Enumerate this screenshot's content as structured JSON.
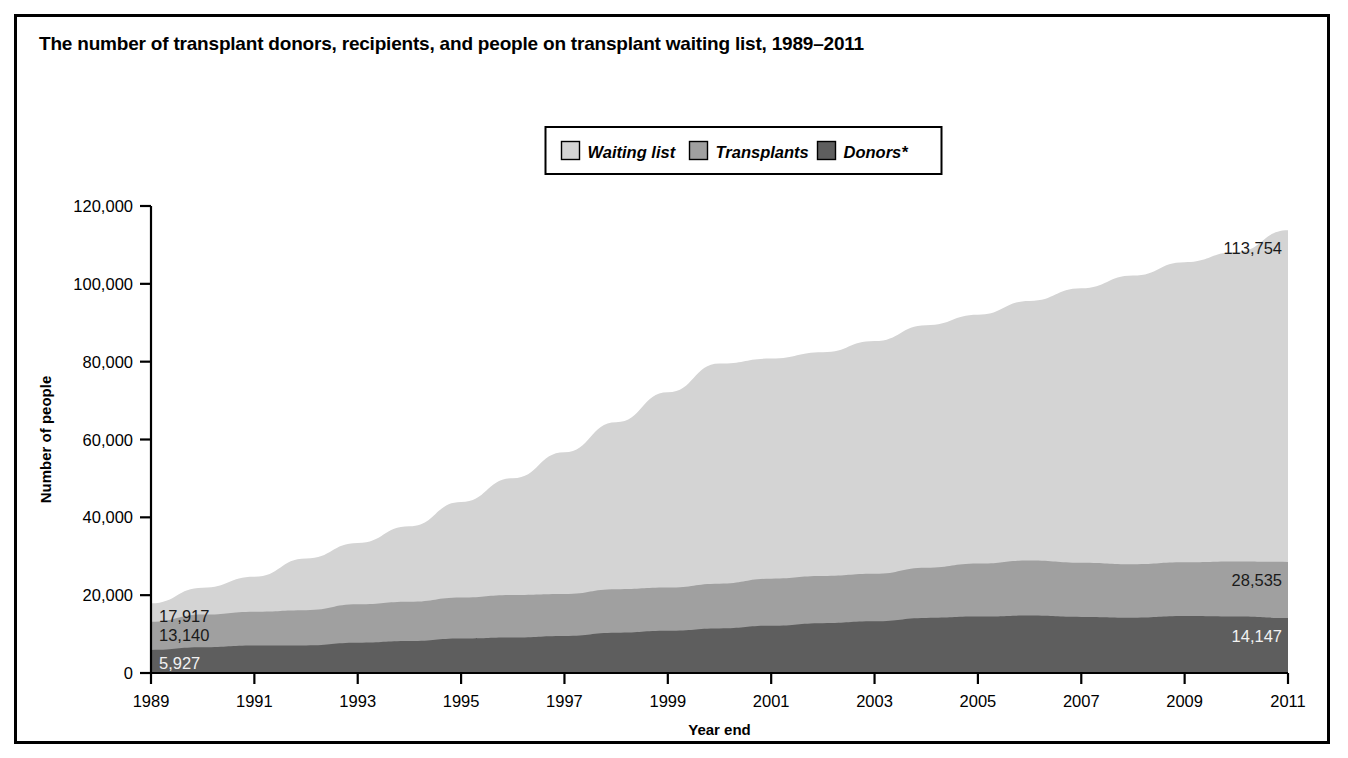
{
  "figure": {
    "title": "The number of transplant donors, recipients, and people on transplant waiting list, 1989–2011",
    "border_color": "#000000",
    "background": "#ffffff"
  },
  "legend": {
    "position": "top-center",
    "items": [
      {
        "label": "Waiting list",
        "color": "#d4d4d4",
        "name": "waiting-list"
      },
      {
        "label": "Transplants",
        "color": "#a0a0a0",
        "name": "transplants"
      },
      {
        "label": "Donors*",
        "color": "#5e5e5e",
        "name": "donors"
      }
    ]
  },
  "annotations": {
    "left": [
      {
        "text": "17,917",
        "series": "Waiting list",
        "light": false
      },
      {
        "text": "13,140",
        "series": "Transplants",
        "light": false
      },
      {
        "text": "5,927",
        "series": "Donors*",
        "light": true
      }
    ],
    "right": [
      {
        "text": "113,754",
        "series": "Waiting list",
        "light": false
      },
      {
        "text": "28,535",
        "series": "Transplants",
        "light": false
      },
      {
        "text": "14,147",
        "series": "Donors*",
        "light": true
      }
    ]
  },
  "chart_data": {
    "type": "area",
    "title": "The number of transplant donors, recipients, and people on transplant waiting list, 1989–2011",
    "xlabel": "Year end",
    "ylabel": "Number of people",
    "grid": false,
    "legend_position": "top-center",
    "stacking": "overlaid",
    "xlim": [
      1989,
      2011
    ],
    "ylim": [
      0,
      120000
    ],
    "yticks": [
      0,
      20000,
      40000,
      60000,
      80000,
      100000,
      120000
    ],
    "ytick_labels": [
      "0",
      "20,000",
      "40,000",
      "60,000",
      "80,000",
      "100,000",
      "120,000"
    ],
    "xticks": [
      1989,
      1991,
      1993,
      1995,
      1997,
      1999,
      2001,
      2003,
      2005,
      2007,
      2009,
      2011
    ],
    "xtick_labels": [
      "1989",
      "1991",
      "1993",
      "1995",
      "1997",
      "1999",
      "2001",
      "2003",
      "2005",
      "2007",
      "2009",
      "2011"
    ],
    "x": [
      1989,
      1990,
      1991,
      1992,
      1993,
      1994,
      1995,
      1996,
      1997,
      1998,
      1999,
      2000,
      2001,
      2002,
      2003,
      2004,
      2005,
      2006,
      2007,
      2008,
      2009,
      2010,
      2011
    ],
    "series": [
      {
        "name": "Waiting list",
        "color": "#d4d4d4",
        "values": [
          17917,
          21914,
          24719,
          29415,
          33394,
          37681,
          43937,
          50052,
          56716,
          64423,
          72110,
          79523,
          80806,
          82402,
          85292,
          89362,
          92048,
          95601,
          98840,
          102124,
          105567,
          108175,
          113754
        ],
        "start_label": "17,917",
        "end_label": "113,754"
      },
      {
        "name": "Transplants",
        "color": "#a0a0a0",
        "values": [
          13140,
          15001,
          15754,
          16134,
          17636,
          18295,
          19396,
          20041,
          20306,
          21520,
          21952,
          22957,
          24233,
          24901,
          25472,
          27035,
          28114,
          28930,
          28358,
          27963,
          28465,
          28664,
          28535
        ],
        "start_label": "13,140",
        "end_label": "28,535"
      },
      {
        "name": "Donors*",
        "color": "#5e5e5e",
        "values": [
          5927,
          6605,
          7042,
          7093,
          7765,
          8194,
          8857,
          9120,
          9527,
          10362,
          10860,
          11457,
          12145,
          12796,
          13281,
          14151,
          14490,
          14753,
          14399,
          14208,
          14630,
          14505,
          14147
        ],
        "start_label": "5,927",
        "end_label": "14,147"
      }
    ]
  },
  "plot_geometry": {
    "left": 134,
    "right": 1271,
    "top": 189,
    "bottom": 656
  }
}
